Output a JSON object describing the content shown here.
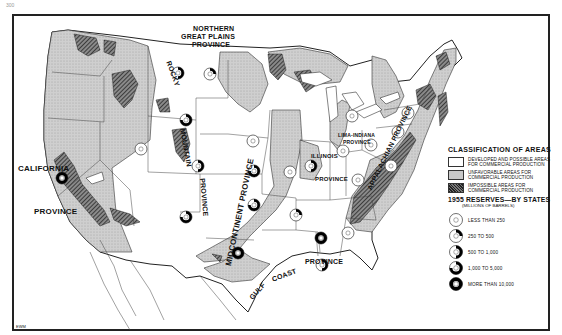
{
  "page": {
    "number": "300"
  },
  "map": {
    "provinces": [
      {
        "id": "northern-great-plains",
        "label": "NORTHERN\nGREAT PLAINS\nPROVINCE"
      },
      {
        "id": "rocky-mountain",
        "label": "ROCKY MOUNTAIN PROVINCE"
      },
      {
        "id": "california",
        "label_top": "CALIFORNIA",
        "label_bottom": "PROVINCE"
      },
      {
        "id": "midcontinent",
        "label": "MIDCONTINENT PROVINCE"
      },
      {
        "id": "illinois",
        "label_top": "ILLINOIS",
        "label_bottom": "PROVINCE"
      },
      {
        "id": "lima-indiana",
        "label_top": "LIMA-INDIANA",
        "label_bottom": "PROVINCE"
      },
      {
        "id": "appalachian",
        "label": "APPALACHIAN PROVINCE"
      },
      {
        "id": "gulf-coast",
        "label_1": "GULF",
        "label_2": "COAST",
        "label_3": "PROVINCE"
      }
    ],
    "credit": "EWM",
    "colors": {
      "developed": "#ffffff",
      "unfavorable": "#c8c8c8",
      "impossible": "#333333",
      "line": "#222222"
    }
  },
  "legend": {
    "title": "CLASSIFICATION OF AREAS",
    "items": [
      {
        "swatch": "white",
        "label": "DEVELOPED AND POSSIBLE AREAS FOR COMMERCIAL PRODUCTION"
      },
      {
        "swatch": "grey",
        "label": "UNFAVORABLE AREAS FOR COMMERCIAL PRODUCTION"
      },
      {
        "swatch": "hatch",
        "label": "IMPOSSIBLE AREAS FOR COMMERCIAL PRODUCTION"
      }
    ],
    "reserves_title": "1955 RESERVES—BY STATES",
    "reserves_subtitle": "(MILLIONS OF BARRELS)",
    "reserves": [
      {
        "label": "LESS THAN 250",
        "fill": 0
      },
      {
        "label": "250 TO 500",
        "fill": 0.25
      },
      {
        "label": "500 TO 1,000",
        "fill": 0.5
      },
      {
        "label": "1,000 TO 5,000",
        "fill": 0.75
      },
      {
        "label": "MORE THAN 10,000",
        "fill": 1
      }
    ]
  },
  "state_markers": [
    {
      "state": "Montana",
      "x": 178,
      "y": 73,
      "cls": 2
    },
    {
      "state": "North Dakota",
      "x": 210,
      "y": 74,
      "cls": 1
    },
    {
      "state": "Wyoming",
      "x": 186,
      "y": 120,
      "cls": 3
    },
    {
      "state": "Colorado",
      "x": 198,
      "y": 166,
      "cls": 2
    },
    {
      "state": "Utah",
      "x": 141,
      "y": 149,
      "cls": 0
    },
    {
      "state": "Nebraska",
      "x": 253,
      "y": 141,
      "cls": 0
    },
    {
      "state": "Kansas",
      "x": 254,
      "y": 171,
      "cls": 3
    },
    {
      "state": "New Mexico",
      "x": 186,
      "y": 217,
      "cls": 3
    },
    {
      "state": "Oklahoma",
      "x": 254,
      "y": 205,
      "cls": 3
    },
    {
      "state": "Texas",
      "x": 238,
      "y": 253,
      "cls": 4
    },
    {
      "state": "California",
      "x": 62,
      "y": 178,
      "cls": 4
    },
    {
      "state": "Arkansas",
      "x": 296,
      "y": 215,
      "cls": 1
    },
    {
      "state": "Louisiana",
      "x": 321,
      "y": 238,
      "cls": 4
    },
    {
      "state": "Mississippi",
      "x": 322,
      "y": 265,
      "cls": 2
    },
    {
      "state": "Illinois",
      "x": 311,
      "y": 166,
      "cls": 2
    },
    {
      "state": "Michigan",
      "x": 352,
      "y": 116,
      "cls": 0
    },
    {
      "state": "Indiana",
      "x": 343,
      "y": 151,
      "cls": 0
    },
    {
      "state": "Ohio",
      "x": 371,
      "y": 145,
      "cls": 0
    },
    {
      "state": "Kentucky",
      "x": 358,
      "y": 180,
      "cls": 0
    },
    {
      "state": "West Virginia",
      "x": 391,
      "y": 166,
      "cls": 0
    },
    {
      "state": "Pennsylvania",
      "x": 398,
      "y": 132,
      "cls": 0
    },
    {
      "state": "New York",
      "x": 408,
      "y": 113,
      "cls": 0
    },
    {
      "state": "Tennessee",
      "x": 348,
      "y": 233,
      "cls": 0
    },
    {
      "state": "Missouri",
      "x": 290,
      "y": 172,
      "cls": 0
    }
  ]
}
